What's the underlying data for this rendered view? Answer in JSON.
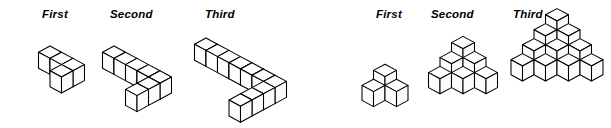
{
  "figure": {
    "background_color": "#ffffff",
    "line_color": "#000000",
    "fill_color": "#ffffff"
  },
  "groups": [
    {
      "name": "left-group",
      "shape_kind": "L-shaped cube arrangement",
      "labels": [
        "First",
        "Second",
        "Third"
      ],
      "terms": [
        {
          "label": "First",
          "cube_count": 4,
          "arm_long": 3,
          "arm_short": 2
        },
        {
          "label": "Second",
          "cube_count": 7,
          "arm_long": 5,
          "arm_short": 3
        },
        {
          "label": "Third",
          "cube_count": 10,
          "arm_long": 7,
          "arm_short": 4
        }
      ]
    },
    {
      "name": "right-group",
      "shape_kind": "triangular cube pyramid",
      "labels": [
        "First",
        "Second",
        "Third"
      ],
      "terms": [
        {
          "label": "First",
          "cube_count": 3,
          "levels": 2,
          "base_width": 2
        },
        {
          "label": "Second",
          "cube_count": 10,
          "levels": 3,
          "base_width": 3
        },
        {
          "label": "Third",
          "cube_count": 20,
          "levels": 4,
          "base_width": 4
        }
      ]
    }
  ],
  "chart_data": {
    "type": "diagram",
    "title": "",
    "series": [
      {
        "name": "L-shaped arrangement",
        "categories": [
          "First",
          "Second",
          "Third"
        ],
        "values": [
          4,
          7,
          10
        ]
      },
      {
        "name": "Triangular pyramid",
        "categories": [
          "First",
          "Second",
          "Third"
        ],
        "values": [
          3,
          10,
          20
        ]
      }
    ]
  },
  "labels_left": {
    "first": "First",
    "second": "Second",
    "third": "Third"
  },
  "labels_right": {
    "first": "First",
    "second": "Second",
    "third": "Third"
  }
}
